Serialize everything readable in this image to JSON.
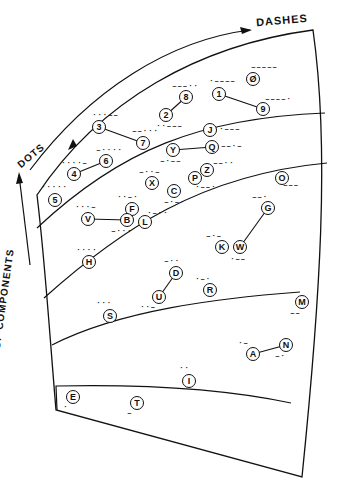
{
  "labels": {
    "dashes": "DASHES",
    "dots": "DOTS",
    "y_axis": "NUMBER   OF   COMPONENTS"
  },
  "colors": {
    "ink": "#111111",
    "paper": "#ffffff"
  },
  "nodes": [
    {
      "ch": "E",
      "code": "·",
      "x": 73,
      "y": 397,
      "cx": 71,
      "cy": 407
    },
    {
      "ch": "T",
      "code": "–",
      "x": 137,
      "y": 403,
      "cx": 135,
      "cy": 413
    },
    {
      "ch": "I",
      "code": "··",
      "x": 189,
      "y": 381,
      "cx": 187,
      "cy": 368
    },
    {
      "ch": "A",
      "code": "·–",
      "x": 253,
      "y": 354,
      "cx": 246,
      "cy": 343
    },
    {
      "ch": "N",
      "code": "–·",
      "x": 286,
      "y": 345,
      "cx": 283,
      "cy": 356
    },
    {
      "ch": "M",
      "code": "––",
      "x": 302,
      "y": 302,
      "cx": 298,
      "cy": 313
    },
    {
      "ch": "S",
      "code": "···",
      "x": 110,
      "y": 316,
      "cx": 104,
      "cy": 303
    },
    {
      "ch": "U",
      "code": "··–",
      "x": 159,
      "y": 297,
      "cx": 148,
      "cy": 307
    },
    {
      "ch": "D",
      "code": "–··",
      "x": 176,
      "y": 273,
      "cx": 172,
      "cy": 261
    },
    {
      "ch": "R",
      "code": "·–·",
      "x": 210,
      "y": 290,
      "cx": 203,
      "cy": 279
    },
    {
      "ch": "K",
      "code": "–·–",
      "x": 222,
      "y": 247,
      "cx": 214,
      "cy": 236
    },
    {
      "ch": "W",
      "code": "·––",
      "x": 240,
      "y": 247,
      "cx": 238,
      "cy": 259
    },
    {
      "ch": "G",
      "code": "––·",
      "x": 268,
      "y": 208,
      "cx": 260,
      "cy": 197
    },
    {
      "ch": "O",
      "code": "–––",
      "x": 282,
      "y": 178,
      "cx": 291,
      "cy": 185
    },
    {
      "ch": "H",
      "code": "····",
      "x": 89,
      "y": 262,
      "cx": 84,
      "cy": 250
    },
    {
      "ch": "V",
      "code": "···–",
      "x": 88,
      "y": 219,
      "cx": 83,
      "cy": 207
    },
    {
      "ch": "F",
      "code": "··–·",
      "x": 132,
      "y": 209,
      "cx": 125,
      "cy": 197
    },
    {
      "ch": "B",
      "code": "–···",
      "x": 127,
      "y": 220,
      "cx": 119,
      "cy": 231
    },
    {
      "ch": "L",
      "code": "·–··",
      "x": 145,
      "y": 222,
      "cx": 155,
      "cy": 213
    },
    {
      "ch": "X",
      "code": "–··–",
      "x": 152,
      "y": 183,
      "cx": 147,
      "cy": 172
    },
    {
      "ch": "C",
      "code": "–·–·",
      "x": 174,
      "y": 191,
      "cx": 172,
      "cy": 202
    },
    {
      "ch": "P",
      "code": "·––·",
      "x": 195,
      "y": 178,
      "cx": 203,
      "cy": 187
    },
    {
      "ch": "Z",
      "code": "––··",
      "x": 207,
      "y": 170,
      "cx": 221,
      "cy": 163
    },
    {
      "ch": "Y",
      "code": "–·––",
      "x": 173,
      "y": 150,
      "cx": 168,
      "cy": 161
    },
    {
      "ch": "Q",
      "code": "––·–",
      "x": 212,
      "y": 147,
      "cx": 229,
      "cy": 146
    },
    {
      "ch": "J",
      "code": "·–––",
      "x": 210,
      "y": 130,
      "cx": 227,
      "cy": 129
    },
    {
      "ch": "5",
      "code": "·····",
      "x": 55,
      "y": 200,
      "cx": 49,
      "cy": 187
    },
    {
      "ch": "4",
      "code": "····–",
      "x": 74,
      "y": 174,
      "cx": 69,
      "cy": 163
    },
    {
      "ch": "6",
      "code": "–····",
      "x": 106,
      "y": 161,
      "cx": 104,
      "cy": 150
    },
    {
      "ch": "3",
      "code": "···––",
      "x": 99,
      "y": 127,
      "cx": 100,
      "cy": 115
    },
    {
      "ch": "7",
      "code": "––···",
      "x": 143,
      "y": 143,
      "cx": 140,
      "cy": 131
    },
    {
      "ch": "2",
      "code": "··–––",
      "x": 166,
      "y": 115,
      "cx": 164,
      "cy": 126
    },
    {
      "ch": "8",
      "code": "–––··",
      "x": 186,
      "y": 97,
      "cx": 180,
      "cy": 86
    },
    {
      "ch": "1",
      "code": "·––––",
      "x": 219,
      "y": 94,
      "cx": 217,
      "cy": 81
    },
    {
      "ch": "9",
      "code": "––––·",
      "x": 263,
      "y": 109,
      "cx": 273,
      "cy": 99
    },
    {
      "ch": "Ø",
      "code": "–––––",
      "x": 253,
      "y": 79,
      "cx": 259,
      "cy": 67
    }
  ],
  "links": [
    [
      "4",
      "6"
    ],
    [
      "3",
      "7"
    ],
    [
      "2",
      "8"
    ],
    [
      "1",
      "9"
    ],
    [
      "Y",
      "Q"
    ],
    [
      "V",
      "B"
    ],
    [
      "G",
      "W"
    ],
    [
      "D",
      "U"
    ],
    [
      "A",
      "N"
    ]
  ]
}
